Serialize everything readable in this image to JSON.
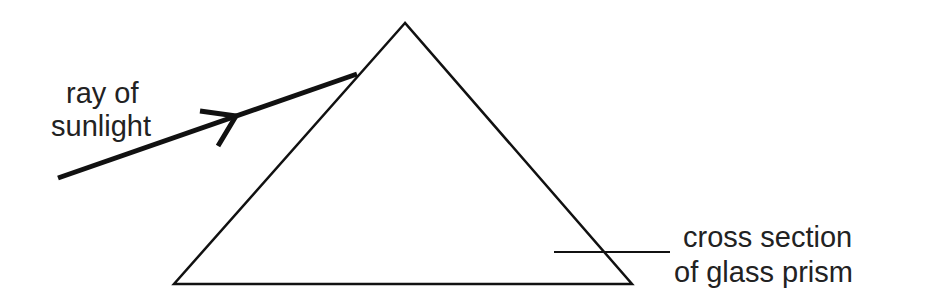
{
  "diagram": {
    "labels": {
      "ray_line1": "ray of",
      "ray_line2": "sunlight",
      "prism_line1": "cross section",
      "prism_line2": "of glass prism"
    },
    "colors": {
      "stroke": "#111111",
      "text": "#222222",
      "background": "#ffffff"
    },
    "prism": {
      "apex": [
        405,
        23
      ],
      "left": [
        174,
        284
      ],
      "right": [
        632,
        284
      ]
    },
    "ray": {
      "start": [
        58,
        178
      ],
      "end": [
        357,
        74
      ],
      "arrow_tip": [
        236,
        116
      ]
    },
    "leader_line": {
      "start": [
        554,
        252
      ],
      "end": [
        670,
        252
      ]
    }
  }
}
